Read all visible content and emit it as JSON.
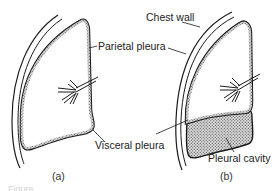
{
  "figure": {
    "panels": [
      {
        "id": "a",
        "label": "(a)"
      },
      {
        "id": "b",
        "label": "(b)"
      }
    ],
    "labels": {
      "chest_wall": "Chest wall",
      "parietal_pleura": "Parietal pleura",
      "visceral_pleura": "Visceral pleura",
      "pleural_cavity": "Pleural cavity"
    },
    "caption_fragment": "Figure",
    "colors": {
      "line": "#1a1a1a",
      "hatch": "#9a9a9a",
      "background": "#ffffff"
    }
  }
}
